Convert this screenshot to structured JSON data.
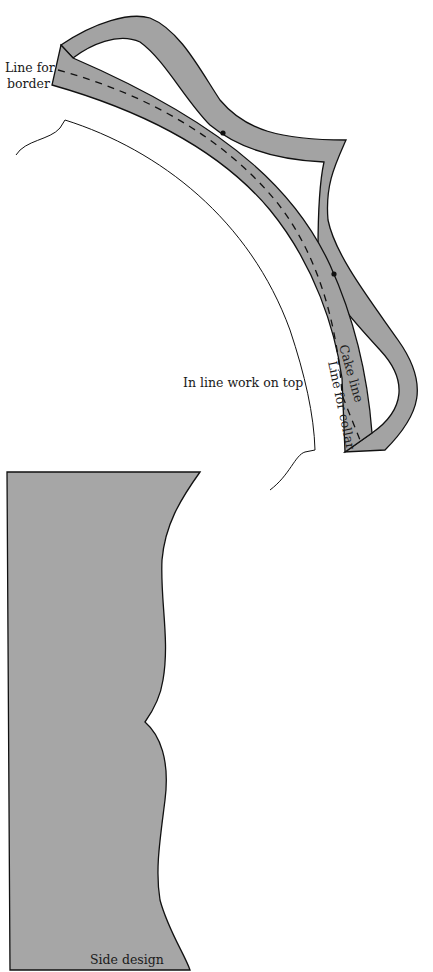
{
  "diagram": {
    "labels": {
      "border": [
        "Line for",
        "border"
      ],
      "inline_work": "In line work on top",
      "cake_line": "Cake line",
      "collar_line": "Line for collar",
      "side_design": "Side design"
    },
    "colors": {
      "band_fill": "#a3a3a3",
      "side_fill": "#a6a6a6",
      "stroke": "#111111",
      "background": "#ffffff"
    }
  }
}
